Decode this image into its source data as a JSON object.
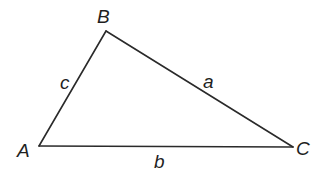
{
  "diagram": {
    "type": "triangle",
    "stroke_color": "#2a2a2a",
    "label_color": "#1f1f1f",
    "vertices": {
      "A": {
        "label": "A",
        "x": 39,
        "y": 146
      },
      "B": {
        "label": "B",
        "x": 106,
        "y": 31
      },
      "C": {
        "label": "C",
        "x": 293,
        "y": 147
      }
    },
    "sides": {
      "a": {
        "label": "a",
        "from": "B",
        "to": "C"
      },
      "b": {
        "label": "b",
        "from": "A",
        "to": "C"
      },
      "c": {
        "label": "c",
        "from": "A",
        "to": "B"
      }
    }
  }
}
